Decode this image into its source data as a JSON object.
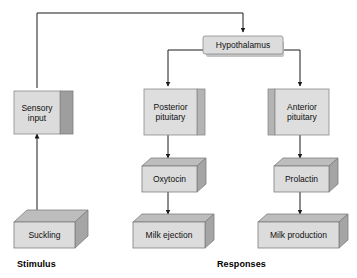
{
  "diagram": {
    "type": "flowchart",
    "colors": {
      "box_face": "#d9d9d9",
      "box_top": "#bcbcbc",
      "box_side": "#a8a8a8",
      "box_stroke": "#7a7a7a",
      "line": "#1a1a1a",
      "text": "#101010",
      "background": "#ffffff"
    },
    "nodes": [
      {
        "id": "hypothalamus",
        "label": "Hypothalamus",
        "style": "flat-shadow"
      },
      {
        "id": "sensory-input",
        "label": "Sensory\ninput",
        "style": "side-panel"
      },
      {
        "id": "posterior-pituitary",
        "label": "Posterior\npituitary",
        "style": "side-panel"
      },
      {
        "id": "anterior-pituitary",
        "label": "Anterior\npituitary",
        "style": "left-panel"
      },
      {
        "id": "suckling",
        "label": "Suckling",
        "style": "block-3d"
      },
      {
        "id": "oxytocin",
        "label": "Oxytocin",
        "style": "block-3d"
      },
      {
        "id": "prolactin",
        "label": "Prolactin",
        "style": "block-3d"
      },
      {
        "id": "milk-ejection",
        "label": "Milk ejection",
        "style": "block-3d"
      },
      {
        "id": "milk-production",
        "label": "Milk production",
        "style": "block-3d"
      }
    ],
    "edges": [
      {
        "from": "suckling",
        "to": "sensory-input"
      },
      {
        "from": "sensory-input",
        "to": "hypothalamus"
      },
      {
        "from": "hypothalamus",
        "to": "posterior-pituitary"
      },
      {
        "from": "hypothalamus",
        "to": "anterior-pituitary"
      },
      {
        "from": "posterior-pituitary",
        "to": "oxytocin"
      },
      {
        "from": "anterior-pituitary",
        "to": "prolactin"
      },
      {
        "from": "oxytocin",
        "to": "milk-ejection"
      },
      {
        "from": "prolactin",
        "to": "milk-production"
      }
    ],
    "section_labels": [
      {
        "id": "stimulus",
        "label": "Stimulus"
      },
      {
        "id": "responses",
        "label": "Responses"
      }
    ]
  }
}
